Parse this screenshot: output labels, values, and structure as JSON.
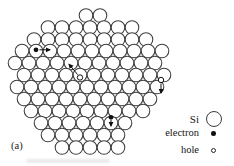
{
  "figure": {
    "label": "(a)"
  },
  "legend": {
    "items": [
      {
        "label": "Si",
        "symbol": "large-open-circle"
      },
      {
        "label": "electron",
        "symbol": "filled-dot"
      },
      {
        "label": "hole",
        "symbol": "small-open-circle"
      }
    ]
  },
  "colors": {
    "background": "#ffffff",
    "lattice_stroke": "#3d3d3d",
    "marker_ink": "#111111"
  },
  "lattice": {
    "circle_diameter": 13.6,
    "rows": [
      {
        "y": 15.5,
        "xs": [
          86,
          100
        ]
      },
      {
        "y": 27.5,
        "xs": [
          48,
          62,
          76,
          90,
          104,
          118,
          132
        ]
      },
      {
        "y": 39.5,
        "xs": [
          34,
          48,
          62,
          76,
          90,
          104,
          118,
          132,
          146
        ]
      },
      {
        "y": 51,
        "xs": [
          22,
          36,
          50,
          64,
          78,
          92,
          106,
          120,
          134,
          148,
          162
        ]
      },
      {
        "y": 63,
        "xs": [
          15,
          29,
          43,
          57,
          71,
          85,
          99,
          113,
          127,
          141,
          155
        ]
      },
      {
        "y": 75,
        "xs": [
          24,
          38,
          52,
          66,
          80,
          94,
          108,
          122,
          136,
          150,
          164
        ]
      },
      {
        "y": 87,
        "xs": [
          17,
          31,
          45,
          59,
          73,
          87,
          101,
          115,
          129,
          143,
          157
        ]
      },
      {
        "y": 99,
        "xs": [
          24,
          38,
          52,
          66,
          80,
          94,
          108,
          122,
          136,
          150
        ]
      },
      {
        "y": 111,
        "xs": [
          31,
          45,
          59,
          73,
          87,
          101,
          115,
          129,
          143
        ]
      },
      {
        "y": 123,
        "xs": [
          41,
          55,
          69,
          83,
          97,
          111,
          125
        ]
      },
      {
        "y": 135,
        "xs": [
          48,
          62,
          76,
          90,
          104,
          118
        ]
      },
      {
        "y": 147.5,
        "xs": [
          62,
          76,
          90,
          104,
          118
        ]
      }
    ]
  },
  "markers": {
    "electrons": [
      {
        "x": 36,
        "y": 49.8,
        "arrow": {
          "x1": 39.5,
          "y1": 49.8,
          "x2": 50,
          "y2": 49.8
        }
      },
      {
        "x": 111,
        "y": 117.3,
        "arrow": {
          "x1": 111,
          "y1": 120,
          "x2": 111,
          "y2": 126
        }
      }
    ],
    "holes": [
      {
        "x": 80,
        "y": 77.5,
        "arrow": {
          "x1": 77.6,
          "y1": 74.6,
          "x2": 69,
          "y2": 64.2
        }
      },
      {
        "x": 161,
        "y": 80,
        "arrow": {
          "x1": 161,
          "y1": 83.5,
          "x2": 161,
          "y2": 93
        }
      }
    ]
  }
}
